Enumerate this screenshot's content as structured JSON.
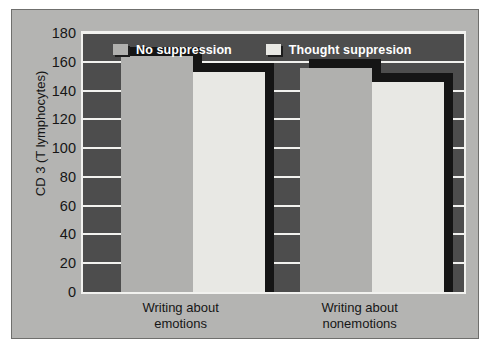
{
  "chart_data": {
    "type": "bar",
    "title": "",
    "xlabel": "",
    "ylabel": "CD 3 (T lymphocytes)",
    "categories": [
      "Writing about emotions",
      "Writing about nonemotions"
    ],
    "category_lines": [
      [
        "Writing about",
        "emotions"
      ],
      [
        "Writing about",
        "nonemotions"
      ]
    ],
    "series": [
      {
        "name": "No suppression",
        "values": [
          164,
          156
        ],
        "color": "#b0b0ae"
      },
      {
        "name": "Thought suppresion",
        "values": [
          153,
          146
        ],
        "color": "#e8e8e4"
      }
    ],
    "ylim": [
      0,
      180
    ],
    "yticks": [
      0,
      20,
      40,
      60,
      80,
      100,
      120,
      140,
      160,
      180
    ],
    "ytick_labels": [
      "0",
      "20",
      "40",
      "60",
      "80",
      "100",
      "120",
      "140",
      "160",
      "180"
    ],
    "grid": true,
    "gridline_color": "#f2f2ef",
    "legend_position": "top-inside",
    "plot_background": "#4d4d4d",
    "figure_background": "#b4b4b2",
    "shadow_color": "#151515"
  }
}
